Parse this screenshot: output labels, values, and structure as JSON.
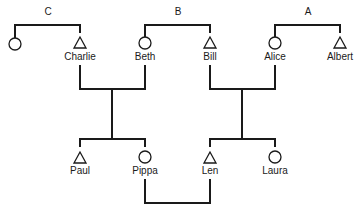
{
  "diagram": {
    "type": "kinship-chart",
    "groups": [
      {
        "id": "C",
        "label": "C",
        "members": [
          "(unnamed female)",
          "Charlie"
        ]
      },
      {
        "id": "B",
        "label": "B",
        "members": [
          "Beth",
          "Bill"
        ]
      },
      {
        "id": "A",
        "label": "A",
        "members": [
          "Alice",
          "Albert"
        ]
      }
    ],
    "people": [
      {
        "name": "",
        "sex": "female",
        "symbol": "circle",
        "generation": 1
      },
      {
        "name": "Charlie",
        "sex": "male",
        "symbol": "triangle",
        "generation": 1
      },
      {
        "name": "Beth",
        "sex": "female",
        "symbol": "circle",
        "generation": 1
      },
      {
        "name": "Bill",
        "sex": "male",
        "symbol": "triangle",
        "generation": 1
      },
      {
        "name": "Alice",
        "sex": "female",
        "symbol": "circle",
        "generation": 1
      },
      {
        "name": "Albert",
        "sex": "male",
        "symbol": "triangle",
        "generation": 1
      },
      {
        "name": "Paul",
        "sex": "male",
        "symbol": "triangle",
        "generation": 2
      },
      {
        "name": "Pippa",
        "sex": "female",
        "symbol": "circle",
        "generation": 2
      },
      {
        "name": "Len",
        "sex": "male",
        "symbol": "triangle",
        "generation": 2
      },
      {
        "name": "Laura",
        "sex": "female",
        "symbol": "circle",
        "generation": 2
      }
    ],
    "marriages": [
      {
        "spouses": [
          "Charlie",
          "Beth"
        ],
        "children": [
          "Paul",
          "Pippa"
        ]
      },
      {
        "spouses": [
          "Bill",
          "Alice"
        ],
        "children": [
          "Len",
          "Laura"
        ]
      },
      {
        "spouses": [
          "Pippa",
          "Len"
        ],
        "children": []
      }
    ],
    "colors": {
      "line": "#1a1a1a",
      "background": "#ffffff"
    }
  }
}
